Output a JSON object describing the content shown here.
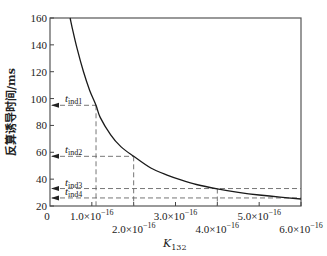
{
  "chart_data": {
    "type": "line",
    "title": "",
    "xlabel": "K",
    "xlabel_sub": "132",
    "ylabel": "反算诱导时间/ms",
    "xlim": [
      0,
      6e-16
    ],
    "ylim": [
      20,
      160
    ],
    "grid": false,
    "legend": null,
    "x_ticks": [
      {
        "value": 0,
        "label": "0",
        "row": 0
      },
      {
        "value": 1e-16,
        "label": "1.0×10",
        "exp": "−16",
        "row": 0
      },
      {
        "value": 2e-16,
        "label": "2.0×10",
        "exp": "−16",
        "row": 1
      },
      {
        "value": 3e-16,
        "label": "3.0×10",
        "exp": "−16",
        "row": 0
      },
      {
        "value": 4e-16,
        "label": "4.0×10",
        "exp": "−16",
        "row": 1
      },
      {
        "value": 5e-16,
        "label": "5.0×10",
        "exp": "−16",
        "row": 0
      },
      {
        "value": 6e-16,
        "label": "6.0×10",
        "exp": "−16",
        "row": 1
      }
    ],
    "y_ticks": [
      20,
      40,
      60,
      80,
      100,
      120,
      140,
      160
    ],
    "series": [
      {
        "name": "induction time curve",
        "x": [
          4.8e-17,
          5.5e-17,
          6.5e-17,
          8e-17,
          9.5e-17,
          1.1e-16,
          1.2e-16,
          1.45e-16,
          1.7e-16,
          2e-16,
          2.41e-16,
          2.8e-16,
          3.13e-16,
          3.5e-16,
          4e-16,
          4.5e-16,
          5e-16,
          5.5e-16,
          6e-16
        ],
        "values": [
          160,
          150,
          137,
          120,
          106,
          95,
          86,
          73,
          64,
          57,
          48.3,
          43,
          39.4,
          36,
          32.7,
          30.2,
          28.2,
          26.6,
          25.2
        ]
      }
    ],
    "annotations": [
      {
        "label": "t",
        "sub": "ind1",
        "y": 95,
        "x": 1.1e-16
      },
      {
        "label": "t",
        "sub": "ind2",
        "y": 57,
        "x": 2e-16
      },
      {
        "label": "t",
        "sub": "ind3",
        "y": 33,
        "x": 4e-16
      },
      {
        "label": "t",
        "sub": "ind4",
        "y": 26,
        "x": 5.9e-16
      }
    ]
  }
}
